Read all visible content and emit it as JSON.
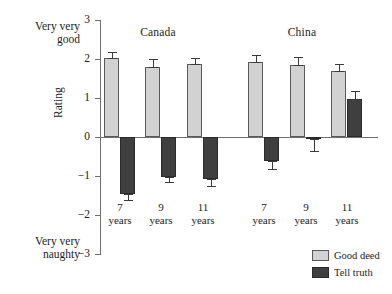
{
  "chart_data": {
    "type": "bar",
    "title": "",
    "xlabel": "",
    "ylabel": "Rating",
    "ylim": [
      -3,
      3
    ],
    "yticks": [
      3,
      2,
      1,
      0,
      -1,
      -2,
      -3
    ],
    "ytick_labels": [
      "3",
      "2",
      "1",
      "0",
      "−1",
      "−2",
      "−3"
    ],
    "grid": false,
    "legend_position": "bottom-right",
    "axis_end_labels": {
      "top": "Very very good",
      "top_line1": "Very very",
      "top_line2": "good",
      "bottom": "Very very naughty",
      "bottom_line1": "Very very",
      "bottom_line2": "naughty"
    },
    "groups": [
      "Canada",
      "China"
    ],
    "categories": [
      "7 years",
      "9 years",
      "11 years",
      "7 years",
      "9 years",
      "11 years"
    ],
    "category_lines": [
      {
        "num": "7",
        "unit": "years"
      },
      {
        "num": "9",
        "unit": "years"
      },
      {
        "num": "11",
        "unit": "years"
      },
      {
        "num": "7",
        "unit": "years"
      },
      {
        "num": "9",
        "unit": "years"
      },
      {
        "num": "11",
        "unit": "years"
      }
    ],
    "series": [
      {
        "name": "Good deed",
        "color": "#d2d2d2",
        "values": [
          2.03,
          1.8,
          1.87,
          1.93,
          1.85,
          1.68
        ],
        "errors": [
          0.14,
          0.19,
          0.15,
          0.18,
          0.21,
          0.18
        ]
      },
      {
        "name": "Tell truth",
        "color": "#3f3f3f",
        "values": [
          -1.45,
          -1.02,
          -1.08,
          -0.62,
          -0.05,
          0.97
        ],
        "errors": [
          0.17,
          0.14,
          0.17,
          0.2,
          0.3,
          0.22
        ]
      }
    ]
  },
  "legend": {
    "items": [
      {
        "label": "Good deed",
        "swatch": "light"
      },
      {
        "label": "Tell truth",
        "swatch": "dark"
      }
    ]
  }
}
